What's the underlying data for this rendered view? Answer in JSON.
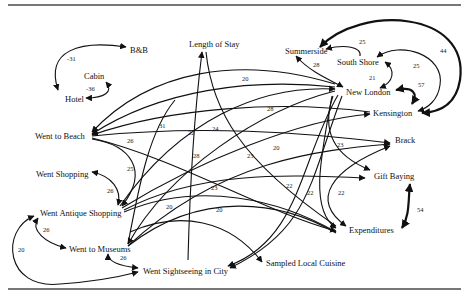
{
  "diagram": {
    "type": "path-diagram",
    "nodes": [
      {
        "id": "bnb",
        "label": "B&B",
        "x": 130,
        "y": 50
      },
      {
        "id": "cabin",
        "label": "Cabin",
        "x": 84,
        "y": 76
      },
      {
        "id": "hotel",
        "label": "Hotel",
        "x": 65,
        "y": 99
      },
      {
        "id": "length_of_stay",
        "label": "Length of Stay",
        "x": 189,
        "y": 45
      },
      {
        "id": "summerside",
        "label": "Summerside",
        "x": 285,
        "y": 51
      },
      {
        "id": "south_shore",
        "label": "South Shore",
        "x": 337,
        "y": 63
      },
      {
        "id": "new_london",
        "label": "New London",
        "x": 346,
        "y": 93
      },
      {
        "id": "kensington",
        "label": "Kensington",
        "x": 373,
        "y": 114
      },
      {
        "id": "went_to_beach",
        "label": "Went to Beach",
        "x": 35,
        "y": 136
      },
      {
        "id": "brack",
        "label": "Brack",
        "x": 395,
        "y": 141
      },
      {
        "id": "went_shopping",
        "label": "Went Shopping",
        "x": 36,
        "y": 175
      },
      {
        "id": "gift_buying",
        "label": "Gift Baying",
        "x": 374,
        "y": 177
      },
      {
        "id": "went_antique_shopping",
        "label": "Went Antique Shopping",
        "x": 40,
        "y": 214
      },
      {
        "id": "expenditures",
        "label": "Expenditures",
        "x": 349,
        "y": 231
      },
      {
        "id": "went_to_museums",
        "label": "Went to Museums",
        "x": 69,
        "y": 250
      },
      {
        "id": "sampled_local_cuisine",
        "label": "Sampled Local Cuisine",
        "x": 266,
        "y": 264
      },
      {
        "id": "went_sightseeing",
        "label": "Went Sightseeing in City",
        "x": 143,
        "y": 272
      }
    ],
    "edge_labels": [
      {
        "text": "-31",
        "x": 67,
        "y": 61
      },
      {
        "text": "-36",
        "x": 86,
        "y": 91
      },
      {
        "text": "20",
        "x": 242,
        "y": 81
      },
      {
        "text": "31",
        "x": 159,
        "y": 128
      },
      {
        "text": "22",
        "x": 188,
        "y": 135
      },
      {
        "text": "24",
        "x": 212,
        "y": 131
      },
      {
        "text": "28",
        "x": 267,
        "y": 111
      },
      {
        "text": "28",
        "x": 313,
        "y": 67
      },
      {
        "text": "25",
        "x": 359,
        "y": 44
      },
      {
        "text": "25",
        "x": 413,
        "y": 68
      },
      {
        "text": "44",
        "x": 440,
        "y": 53
      },
      {
        "text": "21",
        "x": 369,
        "y": 80
      },
      {
        "text": "57",
        "x": 418,
        "y": 87
      },
      {
        "text": "26",
        "x": 127,
        "y": 143
      },
      {
        "text": "28",
        "x": 193,
        "y": 158
      },
      {
        "text": "25",
        "x": 127,
        "y": 171
      },
      {
        "text": "23",
        "x": 247,
        "y": 158
      },
      {
        "text": "20",
        "x": 273,
        "y": 150
      },
      {
        "text": "23",
        "x": 337,
        "y": 147
      },
      {
        "text": "23",
        "x": 211,
        "y": 190
      },
      {
        "text": "22",
        "x": 286,
        "y": 188
      },
      {
        "text": "22",
        "x": 307,
        "y": 195
      },
      {
        "text": "22",
        "x": 338,
        "y": 195
      },
      {
        "text": "26",
        "x": 107,
        "y": 193
      },
      {
        "text": "20",
        "x": 166,
        "y": 209
      },
      {
        "text": "20",
        "x": 216,
        "y": 212
      },
      {
        "text": "54",
        "x": 417,
        "y": 212
      },
      {
        "text": "26",
        "x": 43,
        "y": 232
      },
      {
        "text": "20",
        "x": 18,
        "y": 252
      },
      {
        "text": "26",
        "x": 120,
        "y": 260
      }
    ]
  }
}
